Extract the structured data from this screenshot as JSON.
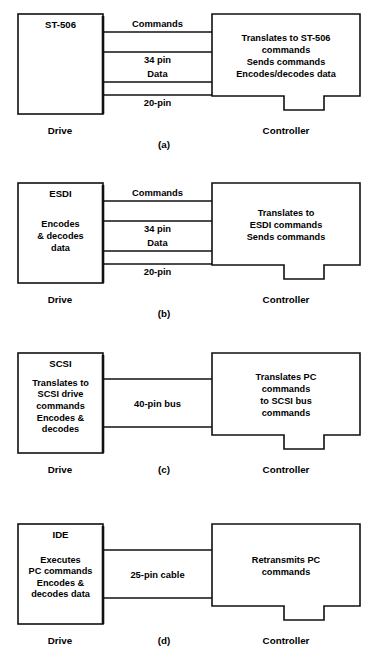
{
  "figure": {
    "width": 377,
    "height": 664,
    "background": "#ffffff",
    "ink": "#111111",
    "side_labels": {
      "drive": "Drive",
      "controller": "Controller"
    }
  },
  "panels": [
    {
      "id": "a",
      "caption": "(a)",
      "drive": {
        "title": "ST-506",
        "body": []
      },
      "controller": {
        "title": "",
        "body": [
          "Translates to ST-506",
          "commands",
          "Sends commands",
          "Encodes/decodes data"
        ]
      },
      "connections": [
        {
          "label": "Commands",
          "label_position": "above",
          "wires": 1
        },
        {
          "label": "34 pin",
          "label_position": "below",
          "wires": 1
        },
        {
          "label": "Data",
          "label_position": "above",
          "wires": 1
        },
        {
          "label": "20-pin",
          "label_position": "below",
          "wires": 1
        }
      ],
      "footer": {
        "drive": "Drive",
        "caption": "(a)",
        "controller": "Controller"
      }
    },
    {
      "id": "b",
      "caption": "(b)",
      "drive": {
        "title": "ESDI",
        "body": [
          "Encodes",
          "& decodes",
          "data"
        ]
      },
      "controller": {
        "title": "",
        "body": [
          "Translates to",
          "ESDI commands",
          "Sends commands"
        ]
      },
      "connections": [
        {
          "label": "Commands",
          "label_position": "above",
          "wires": 1
        },
        {
          "label": "34 pin",
          "label_position": "below",
          "wires": 1
        },
        {
          "label": "Data",
          "label_position": "above",
          "wires": 1
        },
        {
          "label": "20-pin",
          "label_position": "below",
          "wires": 1
        }
      ],
      "footer": {
        "drive": "Drive",
        "caption": "(b)",
        "controller": "Controller"
      }
    },
    {
      "id": "c",
      "caption": "(c)",
      "drive": {
        "title": "SCSI",
        "body": [
          "Translates to",
          "SCSI drive",
          "commands",
          "Encodes &",
          "decodes"
        ]
      },
      "controller": {
        "title": "",
        "body": [
          "Translates PC",
          "commands",
          "to SCSI bus",
          "commands"
        ]
      },
      "connections": [
        {
          "label": "40-pin bus",
          "label_position": "middle",
          "wires": 2
        }
      ],
      "footer": {
        "drive": "Drive",
        "caption": "(c)",
        "controller": "Controller"
      }
    },
    {
      "id": "d",
      "caption": "(d)",
      "drive": {
        "title": "IDE",
        "body": [
          "Executes",
          "PC commands",
          "Encodes &",
          "decodes data"
        ]
      },
      "controller": {
        "title": "",
        "body": [
          "Retransmits PC",
          "commands"
        ]
      },
      "connections": [
        {
          "label": "25-pin cable",
          "label_position": "middle",
          "wires": 2
        }
      ],
      "footer": {
        "drive": "Drive",
        "caption": "(d)",
        "controller": "Controller"
      }
    }
  ],
  "geometry": {
    "panel_tops": [
      14,
      183,
      353,
      524
    ],
    "drive": {
      "x": 18,
      "width": 85,
      "height": 100
    },
    "controller": {
      "x": 212,
      "width": 148,
      "height": 82,
      "tab_height": 14,
      "tab_x_offset": 72,
      "tab_width": 40
    },
    "wire_rows": {
      "four": [
        18,
        38,
        68,
        81
      ],
      "two": [
        26,
        74
      ]
    },
    "footer_offset": 120,
    "drive_label_x": 60,
    "caption_x": 164,
    "controller_label_x": 286
  }
}
